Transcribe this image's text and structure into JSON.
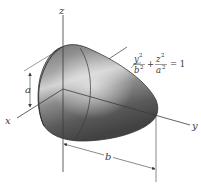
{
  "figure": {
    "type": "3d-surface-diagram",
    "surface_name": "elliptic paraboloid cap",
    "equation": {
      "term1_num": "y",
      "term1_num_exp": "2",
      "term1_den": "b",
      "term1_den_exp": "2",
      "plus": "+",
      "term2_num": "z",
      "term2_num_exp": "2",
      "term2_den": "a",
      "term2_den_exp": "2",
      "equals": "= 1"
    },
    "axes": {
      "x": "x",
      "y": "y",
      "z": "z"
    },
    "dimensions": {
      "a": "a",
      "b": "b"
    },
    "colors": {
      "surface_dark": "#4a4a4a",
      "surface_mid": "#7a7a7a",
      "surface_light": "#c8c8c8",
      "line": "#3a3a3a",
      "background": "#ffffff"
    }
  }
}
